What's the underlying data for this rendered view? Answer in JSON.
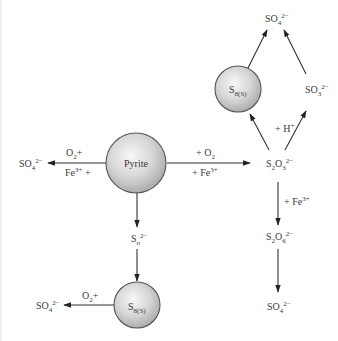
{
  "diagram": {
    "type": "reaction-pathway",
    "nodes": {
      "pyrite": {
        "label": "Pyrite"
      },
      "s8_top": {
        "label_main": "S",
        "label_sub": "8(S)"
      },
      "s8_bottom": {
        "label_main": "S",
        "label_sub": "8(S)"
      },
      "so4_left": {
        "main": "SO",
        "sub": "4",
        "sup": "2−"
      },
      "so4_bottom_left": {
        "main": "SO",
        "sub": "4",
        "sup": "2−"
      },
      "so4_top": {
        "main": "SO",
        "sub": "4",
        "sup": "2−"
      },
      "so4_bottom_right": {
        "main": "SO",
        "sub": "4",
        "sup": "2−"
      },
      "so3": {
        "main": "SO",
        "sub": "3",
        "sup": "2−"
      },
      "s2o3": {
        "m1": "S",
        "s1": "2",
        "m2": "O",
        "s2": "3",
        "sup": "2−"
      },
      "s2o6": {
        "m1": "S",
        "s1": "2",
        "m2": "O",
        "s2": "6",
        "sup": "2−"
      },
      "sn": {
        "main": "S",
        "sub": "n",
        "sup": "2−"
      }
    },
    "edge_labels": {
      "pyrite_to_so4_top": {
        "main": "O",
        "sub": "2",
        "tail": "+"
      },
      "pyrite_to_so4_bottom": {
        "main": "Fe",
        "sup": "3+",
        "tail": " +"
      },
      "pyrite_to_s2o3_top": {
        "pre": "+ O",
        "sub": "2"
      },
      "pyrite_to_s2o3_bottom": {
        "pre": "+ Fe",
        "sup": "3+"
      },
      "s2o3_to_so3": {
        "pre": "+ H",
        "sup": "+"
      },
      "s2o3_to_s2o6": {
        "pre": "+ Fe",
        "sup": "3+"
      },
      "s8_to_so4": {
        "main": "O",
        "sub": "2",
        "tail": "+"
      }
    },
    "colors": {
      "line": "#333333",
      "text": "#3a3a3a",
      "sphere_light": "#f7f7f7",
      "sphere_dark": "#a9a9a9",
      "sphere_stroke": "#555555"
    }
  }
}
